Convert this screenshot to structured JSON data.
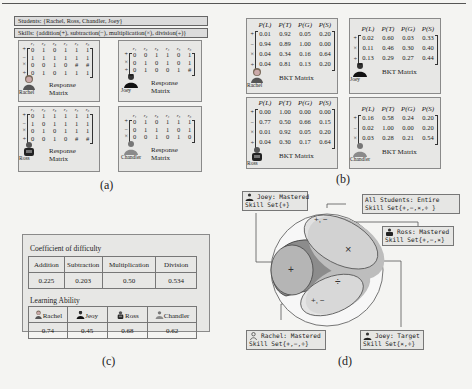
{
  "panel_a": {
    "students_bar": "Students: {Rachel, Ross, Chandler, Joey}",
    "skills_bar": "Skills: {addition(+), subtraction(−), multiplication(×), division(÷)}",
    "col_headers": [
      "r₁",
      "r₂",
      "r₃",
      "r₄",
      "r₅",
      "r₆"
    ],
    "matrix_caption": "Response Matrix",
    "students": [
      {
        "name": "Rachel",
        "ops": [
          "+",
          "−",
          "×",
          "÷"
        ],
        "rows": [
          [
            "0",
            "1",
            "0",
            "1",
            "1",
            "1"
          ],
          [
            "1",
            "1",
            "1",
            "1",
            "1",
            "1"
          ],
          [
            "0",
            "0",
            "1",
            "0",
            "#",
            "#"
          ],
          [
            "0",
            "1",
            "0",
            "1",
            "1",
            "1"
          ]
        ]
      },
      {
        "name": "Joey",
        "ops": [
          "+",
          "×",
          "÷"
        ],
        "rows": [
          [
            "0",
            "0",
            "1",
            "1",
            "0",
            "1"
          ],
          [
            "0",
            "1",
            "0",
            "1",
            "0",
            "1"
          ],
          [
            "0",
            "1",
            "0",
            "0",
            "1",
            "#"
          ]
        ]
      },
      {
        "name": "Ross",
        "ops": [
          "+",
          "−",
          "×",
          "÷"
        ],
        "rows": [
          [
            "0",
            "1",
            "1",
            "1",
            "1",
            "1"
          ],
          [
            "1",
            "0",
            "1",
            "1",
            "1",
            "1"
          ],
          [
            "0",
            "1",
            "0",
            "1",
            "1",
            "1"
          ],
          [
            "0",
            "0",
            "1",
            "0",
            "#",
            "#"
          ]
        ]
      },
      {
        "name": "Chandler",
        "ops": [
          "+",
          "−",
          "×"
        ],
        "rows": [
          [
            "0",
            "1",
            "0",
            "1",
            "1",
            "1"
          ],
          [
            "0",
            "1",
            "1",
            "1",
            "0",
            "1"
          ],
          [
            "0",
            "0",
            "1",
            "0",
            "1",
            "0"
          ]
        ]
      }
    ],
    "label": "(a)"
  },
  "panel_b": {
    "col_headers": [
      "P(L)",
      "P(T)",
      "P(G)",
      "P(S)"
    ],
    "matrix_caption": "BKT Matrix",
    "students": [
      {
        "name": "Rachel",
        "ops": [
          "+",
          "−",
          "×",
          "÷"
        ],
        "rows": [
          [
            "0.01",
            "0.92",
            "0.05",
            "0.20"
          ],
          [
            "0.94",
            "0.89",
            "1.00",
            "0.00"
          ],
          [
            "0.04",
            "0.34",
            "0.16",
            "0.64"
          ],
          [
            "0.04",
            "0.81",
            "0.13",
            "0.20"
          ]
        ]
      },
      {
        "name": "Joey",
        "ops": [
          "+",
          "×",
          "÷"
        ],
        "rows": [
          [
            "0.02",
            "0.60",
            "0.03",
            "0.33"
          ],
          [
            "0.11",
            "0.46",
            "0.30",
            "0.40"
          ],
          [
            "0.13",
            "0.29",
            "0.27",
            "0.44"
          ]
        ]
      },
      {
        "name": "Ross",
        "ops": [
          "+",
          "−",
          "×",
          "÷"
        ],
        "rows": [
          [
            "0.00",
            "1.00",
            "0.00",
            "0.00"
          ],
          [
            "0.77",
            "0.50",
            "0.66",
            "0.15"
          ],
          [
            "0.01",
            "0.92",
            "0.05",
            "0.20"
          ],
          [
            "0.04",
            "0.30",
            "0.17",
            "0.64"
          ]
        ]
      },
      {
        "name": "Chandler",
        "ops": [
          "+",
          "−",
          "×"
        ],
        "rows": [
          [
            "0.16",
            "0.58",
            "0.24",
            "0.20"
          ],
          [
            "0.02",
            "1.00",
            "0.00",
            "0.20"
          ],
          [
            "0.03",
            "0.28",
            "0.21",
            "0.54"
          ]
        ]
      }
    ],
    "label": "(b)"
  },
  "panel_c": {
    "difficulty_title": "Coefficient of difficulty",
    "difficulty_headers": [
      "Addition",
      "Subtraction",
      "Multiplication",
      "Division"
    ],
    "difficulty_values": [
      "0.225",
      "0.203",
      "0.50",
      "0.534"
    ],
    "ability_title": "Learning Ability",
    "ability_headers": [
      "Rachel",
      "Jeoy",
      "Ross",
      "Chandler"
    ],
    "ability_values": [
      "0.74",
      "0.45",
      "0.68",
      "0.62"
    ],
    "label": "(c)"
  },
  "panel_d": {
    "callouts": {
      "joey_mastered": {
        "line1": "Joey: Mastered",
        "line2": "Skill Set{+}"
      },
      "all_students": {
        "line1": "All Students: Entire",
        "line2": "Skill Set{+,−,×,÷ }"
      },
      "ross_mastered": {
        "line1": "Ross: Mastered",
        "line2": "Skill Set{+,−,×}"
      },
      "rachel_mastered": {
        "line1": "Rachel: Mastered",
        "line2": "Skill Set{+,−,÷}"
      },
      "joey_target": {
        "line1": "Joey: Target",
        "line2": "Skill Set{×,÷}"
      }
    },
    "region_labels": {
      "top_ellipse": "+, −",
      "multiply": "×",
      "add": "+",
      "divide": "÷",
      "bottom_ellipse": "+, −"
    },
    "colors": {
      "outer_circle": "#ffffff",
      "dark_region": "#8a8a8a",
      "mid_region": "#a8a8a8",
      "light_ellipse": "#d2d2d2",
      "lighter_ellipse": "#e2e2e2"
    },
    "label": "(d)"
  }
}
